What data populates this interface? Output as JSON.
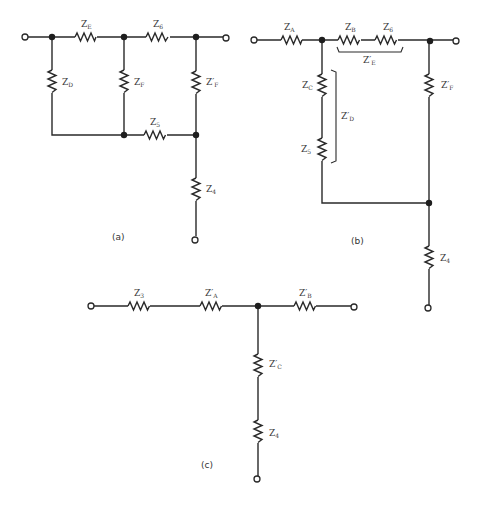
{
  "figure": {
    "panels": [
      {
        "id": "a",
        "caption": "(a)",
        "components": [
          {
            "name": "Z",
            "sub": "E",
            "prime": false
          },
          {
            "name": "Z",
            "sub": "6",
            "prime": false
          },
          {
            "name": "Z",
            "sub": "D",
            "prime": false
          },
          {
            "name": "Z",
            "sub": "F",
            "prime": false
          },
          {
            "name": "Z",
            "sub": "F",
            "prime": true
          },
          {
            "name": "Z",
            "sub": "5",
            "prime": false
          },
          {
            "name": "Z",
            "sub": "4",
            "prime": false
          }
        ]
      },
      {
        "id": "b",
        "caption": "(b)",
        "components": [
          {
            "name": "Z",
            "sub": "A",
            "prime": false
          },
          {
            "name": "Z",
            "sub": "B",
            "prime": false
          },
          {
            "name": "Z",
            "sub": "6",
            "prime": false
          },
          {
            "name": "Z",
            "sub": "E",
            "prime": true
          },
          {
            "name": "Z",
            "sub": "C",
            "prime": false
          },
          {
            "name": "Z",
            "sub": "5",
            "prime": false
          },
          {
            "name": "Z",
            "sub": "D",
            "prime": true
          },
          {
            "name": "Z",
            "sub": "F",
            "prime": true
          },
          {
            "name": "Z",
            "sub": "4",
            "prime": false
          }
        ]
      },
      {
        "id": "c",
        "caption": "(c)",
        "components": [
          {
            "name": "Z",
            "sub": "3",
            "prime": false
          },
          {
            "name": "Z",
            "sub": "A",
            "prime": true
          },
          {
            "name": "Z",
            "sub": "B",
            "prime": true
          },
          {
            "name": "Z",
            "sub": "C",
            "prime": true
          },
          {
            "name": "Z",
            "sub": "4",
            "prime": false
          }
        ]
      }
    ]
  },
  "labels": {
    "a_ze": "Z",
    "a_ze_sub": "E",
    "a_z6": "Z",
    "a_z6_sub": "6",
    "a_zd": "Z",
    "a_zd_sub": "D",
    "a_zf": "Z",
    "a_zf_sub": "F",
    "a_zpf": "Z′",
    "a_zpf_sub": "F",
    "a_z5": "Z",
    "a_z5_sub": "5",
    "a_z4": "Z",
    "a_z4_sub": "4",
    "a_caption": "(a)",
    "b_za": "Z",
    "b_za_sub": "A",
    "b_zb": "Z",
    "b_zb_sub": "B",
    "b_z6": "Z",
    "b_z6_sub": "6",
    "b_zpe": "Z′",
    "b_zpe_sub": "E",
    "b_zc": "Z",
    "b_zc_sub": "C",
    "b_z5": "Z",
    "b_z5_sub": "5",
    "b_zpd": "Z′",
    "b_zpd_sub": "D",
    "b_zpf": "Z′",
    "b_zpf_sub": "F",
    "b_z4": "Z",
    "b_z4_sub": "4",
    "b_caption": "(b)",
    "c_z3": "Z",
    "c_z3_sub": "3",
    "c_zpa": "Z′",
    "c_zpa_sub": "A",
    "c_zpb": "Z′",
    "c_zpb_sub": "B",
    "c_zpc": "Z′",
    "c_zpc_sub": "C",
    "c_z4": "Z",
    "c_z4_sub": "4",
    "c_caption": "(c)"
  },
  "colors": {
    "line": "#2a2a2a",
    "background": "#ffffff"
  }
}
